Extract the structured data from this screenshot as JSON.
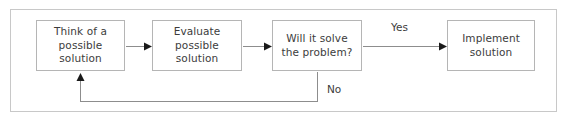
{
  "diagram": {
    "background_color": "#ffffff",
    "frame_border_color": "#c8c8c8",
    "node_border_color": "#b5b5b5",
    "text_color": "#3c3c3c",
    "connector_color": "#8d8d8d",
    "arrowhead_color": "#1a1a1a",
    "nodes": [
      {
        "id": "think",
        "label": "Think of a possible solution",
        "shape": "rectangle"
      },
      {
        "id": "evaluate",
        "label": "Evaluate possible solution",
        "shape": "rectangle"
      },
      {
        "id": "decision",
        "label": "Will it solve the problem?",
        "shape": "rectangle"
      },
      {
        "id": "implement",
        "label": "Implement solution",
        "shape": "rectangle"
      }
    ],
    "edges": [
      {
        "id": "think-to-evaluate",
        "from": "think",
        "to": "evaluate",
        "label": ""
      },
      {
        "id": "evaluate-to-decision",
        "from": "evaluate",
        "to": "decision",
        "label": ""
      },
      {
        "id": "decision-to-implement",
        "from": "decision",
        "to": "implement",
        "label": "Yes"
      },
      {
        "id": "decision-back-to-think",
        "from": "decision",
        "to": "think",
        "label": "No"
      }
    ],
    "labels": {
      "yes": "Yes",
      "no": "No"
    }
  }
}
